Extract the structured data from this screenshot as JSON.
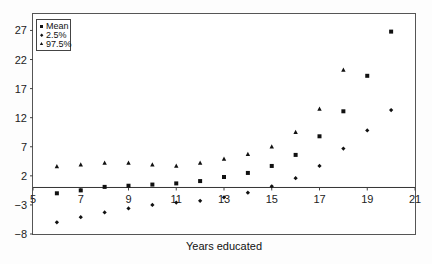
{
  "chart_data": {
    "type": "scatter",
    "title": "",
    "xlabel": "Years educated",
    "ylabel": "",
    "xlim": [
      5,
      21
    ],
    "ylim": [
      -8,
      30
    ],
    "x_ticks": [
      5,
      7,
      9,
      11,
      13,
      15,
      17,
      19,
      21
    ],
    "y_ticks": [
      -8,
      -3,
      2,
      7,
      12,
      17,
      22,
      27
    ],
    "grid": false,
    "legend_position": "top-left",
    "x": [
      6,
      7,
      8,
      9,
      10,
      11,
      12,
      13,
      14,
      15,
      16,
      17,
      18,
      19,
      20
    ],
    "series": [
      {
        "name": "Mean",
        "marker": "square",
        "values": [
          -1.0,
          -0.5,
          0.1,
          0.3,
          0.5,
          0.7,
          1.1,
          1.8,
          2.5,
          3.7,
          5.6,
          8.8,
          13.1,
          19.2,
          26.8
        ]
      },
      {
        "name": "2.5%",
        "marker": "diamond",
        "values": [
          -6.0,
          -5.1,
          -4.3,
          -3.6,
          -3.0,
          -2.6,
          -2.3,
          -1.7,
          -0.9,
          0.2,
          1.6,
          3.7,
          6.7,
          9.8,
          13.3
        ]
      },
      {
        "name": "97.5%",
        "marker": "triangle",
        "values": [
          3.6,
          3.9,
          4.2,
          4.2,
          3.9,
          3.7,
          4.2,
          4.9,
          5.7,
          7.0,
          9.5,
          13.5,
          20.2,
          null,
          null
        ]
      }
    ]
  }
}
